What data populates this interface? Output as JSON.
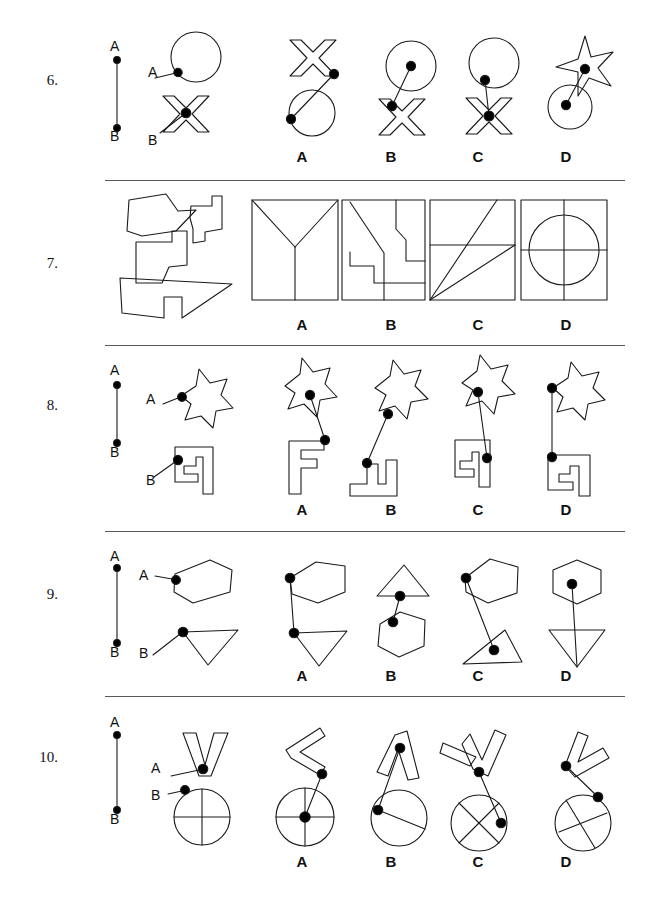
{
  "page": {
    "width": 654,
    "height": 903,
    "background": "#ffffff",
    "stroke_color": "#1a1a1a",
    "dot_color": "#000000",
    "separator_color": "#5a5a5a",
    "test_type": "spatial-reasoning-shape-assembly"
  },
  "option_letters": [
    "A",
    "B",
    "C",
    "D"
  ],
  "option_letter_x": [
    302,
    391,
    478,
    566
  ],
  "separators": [
    {
      "y": 180,
      "x1": 105,
      "x2": 625
    },
    {
      "y": 345,
      "x1": 105,
      "x2": 625
    },
    {
      "y": 531,
      "x1": 105,
      "x2": 625
    },
    {
      "y": 696,
      "x1": 105,
      "x2": 625
    }
  ],
  "questions": [
    {
      "number": "6.",
      "number_y": 80,
      "has_ab_ruler": true,
      "ruler": {
        "x": 117,
        "a_y": 60,
        "b_y": 128,
        "a_label": "A",
        "b_label": "B"
      },
      "prompt_shapes": [
        "circle",
        "x-shape"
      ],
      "prompt_labels": [
        "A",
        "B"
      ],
      "option_letters_y": 157,
      "options": [
        {
          "letter": "A",
          "shapes": [
            "x-shape",
            "circle"
          ],
          "joined": "tip-to-tip"
        },
        {
          "letter": "B",
          "shapes": [
            "circle",
            "x-shape"
          ],
          "joined": "center-to-arm"
        },
        {
          "letter": "C",
          "shapes": [
            "circle",
            "x-shape"
          ],
          "joined": "edge-to-center"
        },
        {
          "letter": "D",
          "shapes": [
            "4-point-star",
            "circle"
          ],
          "joined": "center-to-center"
        }
      ]
    },
    {
      "number": "7.",
      "number_y": 263,
      "has_ab_ruler": false,
      "prompt_shapes": [
        "irregular-polygon-piece-1",
        "irregular-polygon-piece-2",
        "irregular-polygon-piece-3"
      ],
      "option_letters_y": 325,
      "options": [
        {
          "letter": "A",
          "shapes": [
            "square-with-y-division"
          ]
        },
        {
          "letter": "B",
          "shapes": [
            "square-with-zigzag-division"
          ]
        },
        {
          "letter": "C",
          "shapes": [
            "square-with-diagonal-division"
          ]
        },
        {
          "letter": "D",
          "shapes": [
            "square-with-circle-and-cross"
          ]
        }
      ]
    },
    {
      "number": "8.",
      "number_y": 405,
      "has_ab_ruler": true,
      "ruler": {
        "x": 117,
        "a_y": 385,
        "b_y": 443,
        "a_label": "A",
        "b_label": "B"
      },
      "prompt_shapes": [
        "6-point-star",
        "f-shape"
      ],
      "prompt_labels": [
        "A",
        "B"
      ],
      "option_letters_y": 510,
      "options": [
        {
          "letter": "A",
          "shapes": [
            "6-point-star",
            "f-shape"
          ],
          "joined": "short-link"
        },
        {
          "letter": "B",
          "shapes": [
            "6-point-star",
            "l-shape"
          ],
          "joined": "long-link"
        },
        {
          "letter": "C",
          "shapes": [
            "6-point-star",
            "f-shape"
          ],
          "joined": "long-link"
        },
        {
          "letter": "D",
          "shapes": [
            "6-point-star",
            "f-shape"
          ],
          "joined": "vertical-link"
        }
      ]
    },
    {
      "number": "9.",
      "number_y": 594,
      "has_ab_ruler": true,
      "ruler": {
        "x": 117,
        "a_y": 568,
        "b_y": 643,
        "a_label": "A",
        "b_label": "B"
      },
      "prompt_shapes": [
        "hexagon",
        "triangle"
      ],
      "prompt_labels": [
        "A",
        "B"
      ],
      "option_letters_y": 676,
      "options": [
        {
          "letter": "A",
          "shapes": [
            "hexagon",
            "triangle"
          ],
          "joined": "left-vertex"
        },
        {
          "letter": "B",
          "shapes": [
            "triangle",
            "hexagon"
          ],
          "joined": "vertical-link"
        },
        {
          "letter": "C",
          "shapes": [
            "hexagon",
            "triangle"
          ],
          "joined": "long-diagonal"
        },
        {
          "letter": "D",
          "shapes": [
            "hexagon",
            "inverted-triangle"
          ],
          "joined": "center-to-center"
        }
      ]
    },
    {
      "number": "10.",
      "number_y": 757,
      "has_ab_ruler": true,
      "ruler": {
        "x": 117,
        "a_y": 735,
        "b_y": 810,
        "a_label": "A",
        "b_label": "B"
      },
      "prompt_shapes": [
        "v-shape",
        "circle-with-cross"
      ],
      "prompt_labels": [
        "A",
        "B"
      ],
      "option_letters_y": 862,
      "options": [
        {
          "letter": "A",
          "shapes": [
            "v-shape-rotated",
            "circle-with-cross"
          ],
          "joined": "center"
        },
        {
          "letter": "B",
          "shapes": [
            "v-shape-narrow",
            "circle-with-chord"
          ],
          "joined": "edge"
        },
        {
          "letter": "C",
          "shapes": [
            "v-shape-tilted",
            "circle-with-x"
          ],
          "joined": "edge"
        },
        {
          "letter": "D",
          "shapes": [
            "v-shape-tilted",
            "circle-with-cross-tilted"
          ],
          "joined": "edge"
        }
      ]
    }
  ]
}
